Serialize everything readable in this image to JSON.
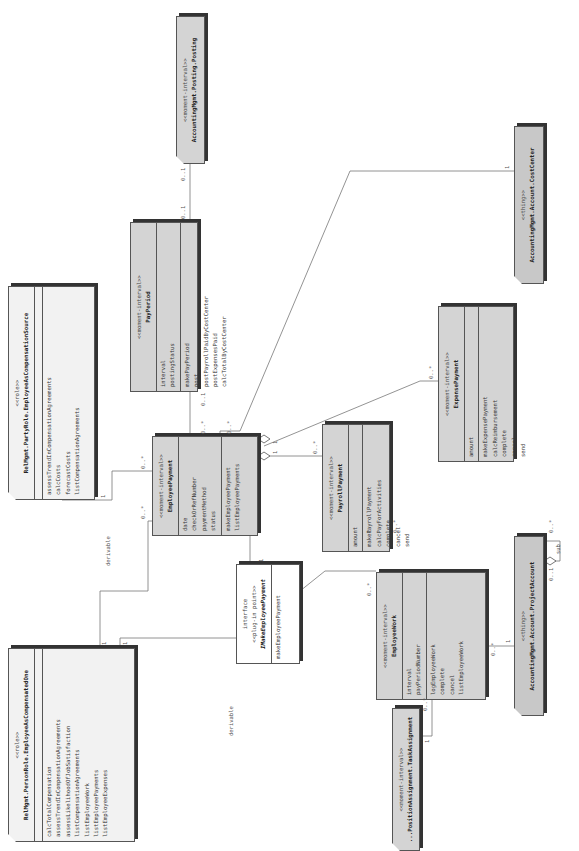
{
  "diagram": {
    "classes": {
      "compensated_one": {
        "stereotype": "<<role>>",
        "name": "RelMgmt.PersonRole.EmployeeAsCompensatedOne",
        "attributes": [],
        "operations": [
          "calcTotalCompensation",
          "assessTrendInCompensationAgreements",
          "assessLikelihoodOfJobSatisfaction",
          "listCompensationAgreements",
          "listEmployeeWork",
          "listEmployeePayments",
          "listEmployeeExpenses"
        ]
      },
      "compensation_source": {
        "stereotype": "<<role>>",
        "name": "RelMgmt.PartyRole.EmployeeAsCompensationSource",
        "attributes": [],
        "operations": [
          "assessTrendInCompensationAgreements",
          "calcCosts",
          "forecastCosts",
          "listCompensationAgreements"
        ]
      },
      "pay_period": {
        "stereotype": "<<moment-interval>>",
        "name": "PayPeriod",
        "attributes": [
          "interval",
          "postingStatus"
        ],
        "operations": [
          "makePayPeriod",
          "post",
          "postPayrollPaidByCostCenter",
          "postExpensesPaid",
          "calcTotalByCostCenter"
        ]
      },
      "posting": {
        "stereotype": "<<moment-interval>>",
        "name": "AccountingMgmt.Posting.Posting"
      },
      "employee_payment": {
        "stereotype": "<<moment-interval>>",
        "name": "EmployeePayment",
        "attributes": [
          "date",
          "checkOrRefNumber",
          "paymentMethod",
          "status"
        ],
        "operations": [
          "makeEmployeePayment",
          "listEmployeePayments"
        ]
      },
      "imake_employee_payment": {
        "kind": "interface",
        "stereotype": "<<plug-in point>>",
        "name": "IMakeEmployeePayment",
        "operations": [
          "makeEmployeePayment"
        ]
      },
      "payroll_payment": {
        "stereotype": "<<moment-interval>>",
        "name": "PayrollPayment",
        "attributes": [
          "amount"
        ],
        "operations": [
          "makePayrollPayment",
          "calcPayForActivities",
          "complete",
          "cancel",
          "send"
        ]
      },
      "expense_payment": {
        "stereotype": "<<moment-interval>>",
        "name": "ExpensePayment",
        "attributes": [
          "amount"
        ],
        "operations": [
          "makeExpensePayment",
          "calcReimbursement",
          "complete",
          "cancel",
          "send"
        ]
      },
      "cost_center": {
        "stereotype": "<<thing>>",
        "name": "AccountingMgmt.Account.CostCenter"
      },
      "employee_work": {
        "stereotype": "<<moment-interval>>",
        "name": "EmployeeWork",
        "attributes": [
          "interval",
          "payPeriodNumber"
        ],
        "operations": [
          "logEmployeeWork",
          "complete",
          "cancel",
          "listEmployeeWork"
        ]
      },
      "project_account": {
        "stereotype": "<<thing>>",
        "name": "AccountingMgmt.Account.ProjectAccount"
      },
      "task_assignment": {
        "stereotype": "<<moment-interval>>",
        "name": "...PositionAssignment.TaskAssignment"
      }
    },
    "labels": {
      "derivable_1": "derivable",
      "derivable_2": "derivable",
      "sub": "sub",
      "m_one": "1",
      "m_zero_one": "0..1",
      "m_zero_many": "0..*"
    }
  }
}
